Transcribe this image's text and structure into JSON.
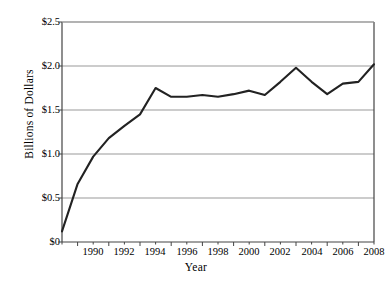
{
  "chart_data": {
    "type": "line",
    "title": "",
    "xlabel": "Year",
    "ylabel": "Billions of Dollars",
    "xlim": [
      1989,
      2009
    ],
    "ylim": [
      0,
      2.5
    ],
    "grid": true,
    "legend": null,
    "y_tick_labels": [
      "$2.5",
      "$2.0",
      "$1.5",
      "$1.0",
      "$0.5",
      "$0"
    ],
    "y_tick_values": [
      2.5,
      2.0,
      1.5,
      1.0,
      0.5,
      0
    ],
    "x_tick_labels": [
      "1990",
      "1992",
      "1994",
      "1996",
      "1998",
      "2000",
      "2002",
      "2004",
      "2006",
      "2008"
    ],
    "x_tick_values": [
      1990,
      1992,
      1994,
      1996,
      1998,
      2000,
      2002,
      2004,
      2006,
      2008
    ],
    "x": [
      1989,
      1990,
      1991,
      1992,
      1993,
      1994,
      1995,
      1996,
      1997,
      1998,
      1999,
      2000,
      2001,
      2002,
      2003,
      2004,
      2005,
      2006,
      2007,
      2008,
      2009
    ],
    "values": [
      0.12,
      0.66,
      0.97,
      1.18,
      1.32,
      1.45,
      1.75,
      1.65,
      1.65,
      1.67,
      1.65,
      1.68,
      1.72,
      1.67,
      1.82,
      1.98,
      1.82,
      1.68,
      1.8,
      1.82,
      2.02
    ],
    "series": [
      {
        "name": "Billions of Dollars",
        "color": "#222222",
        "values": [
          0.12,
          0.66,
          0.97,
          1.18,
          1.32,
          1.45,
          1.75,
          1.65,
          1.65,
          1.67,
          1.65,
          1.68,
          1.72,
          1.67,
          1.82,
          1.98,
          1.82,
          1.68,
          1.8,
          1.82,
          2.02
        ]
      }
    ],
    "colors": {
      "line": "#222222",
      "grid": "#999999",
      "axis": "#444444",
      "background": "#ffffff"
    }
  }
}
